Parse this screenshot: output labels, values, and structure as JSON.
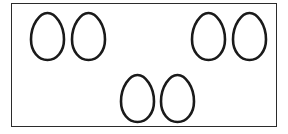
{
  "scene": {
    "title": "Six egg outlines inside a rectangular frame",
    "background_color": "#ffffff",
    "width": 288,
    "height": 134
  },
  "frame": {
    "name": "rectangular-border",
    "stroke_color": "#2b2b2b",
    "fill_color": "#ffffff",
    "x": 11,
    "y": 3,
    "width": 266,
    "height": 124,
    "stroke_width": 1.4
  },
  "shapes": {
    "kind": "egg-outline",
    "count": 6,
    "stroke_color": "#1a1a1a",
    "fill_color": "none",
    "stroke_width": 2.6,
    "item_width": 39,
    "item_height": 51,
    "groups": [
      {
        "name": "top-left-pair",
        "count": 2,
        "items": [
          {
            "label": "egg-1",
            "x": 27,
            "y": 10
          },
          {
            "label": "egg-2",
            "x": 68,
            "y": 10
          }
        ]
      },
      {
        "name": "top-right-pair",
        "count": 2,
        "items": [
          {
            "label": "egg-3",
            "x": 188,
            "y": 10
          },
          {
            "label": "egg-4",
            "x": 229,
            "y": 10
          }
        ]
      },
      {
        "name": "bottom-center-pair",
        "count": 2,
        "items": [
          {
            "label": "egg-5",
            "x": 117,
            "y": 72
          },
          {
            "label": "egg-6",
            "x": 157,
            "y": 72
          }
        ]
      }
    ]
  },
  "egg_path": "M19.5 2 C27.5 2 36 14 36 28.5 C36 40.5 28.6 49 19.5 49 C10.4 49 3 40.5 3 28.5 C3 14 11.5 2 19.5 2 Z"
}
